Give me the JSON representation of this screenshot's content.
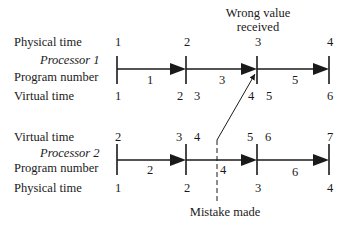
{
  "annotations": {
    "wrong_value_line1": "Wrong value",
    "wrong_value_line2": "received",
    "mistake_made": "Mistake made"
  },
  "processor1": {
    "title": "Processor 1",
    "row_labels": {
      "physical_time": "Physical time",
      "program_number": "Program number",
      "virtual_time": "Virtual time"
    },
    "physical_time_ticks": [
      "1",
      "2",
      "3",
      "4"
    ],
    "program_numbers": [
      "1",
      "3",
      "5"
    ],
    "virtual_times": [
      "1",
      "2",
      "3",
      "4",
      "5",
      "6"
    ]
  },
  "processor2": {
    "title": "Processor 2",
    "row_labels": {
      "virtual_time": "Virtual time",
      "program_number": "Program number",
      "physical_time": "Physical time"
    },
    "virtual_times": [
      "2",
      "3",
      "4",
      "5",
      "6",
      "7"
    ],
    "program_numbers": [
      "2",
      "4",
      "6"
    ],
    "physical_time_ticks": [
      "1",
      "2",
      "3",
      "4"
    ]
  }
}
